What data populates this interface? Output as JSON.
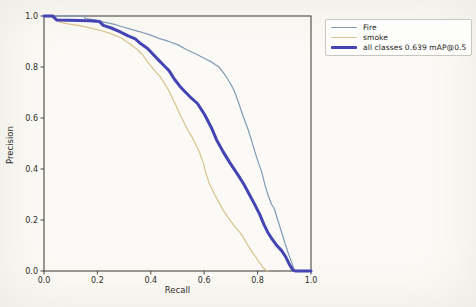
{
  "figure": {
    "xlabel": "Recall",
    "ylabel": "Precision"
  },
  "chart_data": {
    "type": "line",
    "title": "",
    "xlabel": "Recall",
    "ylabel": "Precision",
    "xlim": [
      0,
      1
    ],
    "ylim": [
      0,
      1
    ],
    "xticks": [
      0.0,
      0.2,
      0.4,
      0.6,
      0.8,
      1.0
    ],
    "yticks": [
      0.0,
      0.2,
      0.4,
      0.6,
      0.8,
      1.0
    ],
    "grid": false,
    "legend_position": "outside-upper-right",
    "frame_color": "#4a4741",
    "series": [
      {
        "name": "Fire",
        "color": "#7f9cb5",
        "linewidth": 1.2,
        "points": [
          [
            0,
            1
          ],
          [
            0.03,
            1
          ],
          [
            0.07,
            1
          ],
          [
            0.11,
            1
          ],
          [
            0.148,
            1
          ],
          [
            0.155,
            0.99
          ],
          [
            0.19,
            0.985
          ],
          [
            0.225,
            0.976
          ],
          [
            0.26,
            0.968
          ],
          [
            0.29,
            0.959
          ],
          [
            0.32,
            0.95
          ],
          [
            0.36,
            0.938
          ],
          [
            0.4,
            0.925
          ],
          [
            0.43,
            0.912
          ],
          [
            0.465,
            0.901
          ],
          [
            0.5,
            0.888
          ],
          [
            0.535,
            0.868
          ],
          [
            0.565,
            0.853
          ],
          [
            0.6,
            0.834
          ],
          [
            0.63,
            0.818
          ],
          [
            0.655,
            0.8
          ],
          [
            0.672,
            0.778
          ],
          [
            0.688,
            0.753
          ],
          [
            0.702,
            0.728
          ],
          [
            0.713,
            0.705
          ],
          [
            0.728,
            0.662
          ],
          [
            0.746,
            0.606
          ],
          [
            0.762,
            0.562
          ],
          [
            0.776,
            0.517
          ],
          [
            0.79,
            0.468
          ],
          [
            0.803,
            0.425
          ],
          [
            0.815,
            0.39
          ],
          [
            0.828,
            0.335
          ],
          [
            0.84,
            0.295
          ],
          [
            0.852,
            0.262
          ],
          [
            0.863,
            0.243
          ],
          [
            0.876,
            0.198
          ],
          [
            0.89,
            0.152
          ],
          [
            0.903,
            0.108
          ],
          [
            0.916,
            0.066
          ],
          [
            0.928,
            0.033
          ],
          [
            0.938,
            0.004
          ],
          [
            0.94,
            0
          ]
        ]
      },
      {
        "name": "smoke",
        "color": "#d9c38c",
        "linewidth": 1.2,
        "points": [
          [
            0,
            1
          ],
          [
            0.02,
            1
          ],
          [
            0.038,
            0.99
          ],
          [
            0.058,
            0.976
          ],
          [
            0.095,
            0.968
          ],
          [
            0.135,
            0.962
          ],
          [
            0.175,
            0.952
          ],
          [
            0.22,
            0.941
          ],
          [
            0.255,
            0.929
          ],
          [
            0.288,
            0.915
          ],
          [
            0.318,
            0.893
          ],
          [
            0.348,
            0.87
          ],
          [
            0.368,
            0.849
          ],
          [
            0.393,
            0.813
          ],
          [
            0.417,
            0.783
          ],
          [
            0.434,
            0.763
          ],
          [
            0.453,
            0.733
          ],
          [
            0.468,
            0.706
          ],
          [
            0.488,
            0.663
          ],
          [
            0.513,
            0.606
          ],
          [
            0.538,
            0.554
          ],
          [
            0.553,
            0.528
          ],
          [
            0.57,
            0.492
          ],
          [
            0.583,
            0.464
          ],
          [
            0.597,
            0.423
          ],
          [
            0.608,
            0.378
          ],
          [
            0.62,
            0.342
          ],
          [
            0.638,
            0.303
          ],
          [
            0.653,
            0.272
          ],
          [
            0.672,
            0.237
          ],
          [
            0.688,
            0.212
          ],
          [
            0.708,
            0.183
          ],
          [
            0.728,
            0.158
          ],
          [
            0.744,
            0.137
          ],
          [
            0.76,
            0.107
          ],
          [
            0.778,
            0.078
          ],
          [
            0.798,
            0.047
          ],
          [
            0.818,
            0.017
          ],
          [
            0.833,
            0.002
          ],
          [
            0.84,
            0
          ]
        ]
      },
      {
        "name": "all classes 0.639 mAP@0.5",
        "color": "#4444b4",
        "linewidth": 3,
        "points": [
          [
            0,
            1
          ],
          [
            0.033,
            1
          ],
          [
            0.048,
            0.984
          ],
          [
            0.09,
            0.983
          ],
          [
            0.13,
            0.982
          ],
          [
            0.17,
            0.981
          ],
          [
            0.208,
            0.978
          ],
          [
            0.222,
            0.963
          ],
          [
            0.252,
            0.953
          ],
          [
            0.283,
            0.939
          ],
          [
            0.313,
            0.923
          ],
          [
            0.342,
            0.91
          ],
          [
            0.363,
            0.891
          ],
          [
            0.388,
            0.873
          ],
          [
            0.412,
            0.846
          ],
          [
            0.433,
            0.823
          ],
          [
            0.452,
            0.803
          ],
          [
            0.468,
            0.786
          ],
          [
            0.488,
            0.753
          ],
          [
            0.508,
            0.726
          ],
          [
            0.528,
            0.703
          ],
          [
            0.547,
            0.683
          ],
          [
            0.575,
            0.657
          ],
          [
            0.602,
            0.613
          ],
          [
            0.627,
            0.562
          ],
          [
            0.646,
            0.515
          ],
          [
            0.67,
            0.469
          ],
          [
            0.696,
            0.425
          ],
          [
            0.726,
            0.378
          ],
          [
            0.748,
            0.341
          ],
          [
            0.768,
            0.302
          ],
          [
            0.788,
            0.263
          ],
          [
            0.808,
            0.222
          ],
          [
            0.824,
            0.182
          ],
          [
            0.84,
            0.148
          ],
          [
            0.855,
            0.124
          ],
          [
            0.872,
            0.1
          ],
          [
            0.89,
            0.08
          ],
          [
            0.905,
            0.056
          ],
          [
            0.918,
            0.028
          ],
          [
            0.932,
            0.004
          ],
          [
            0.94,
            0
          ],
          [
            1,
            0
          ]
        ]
      }
    ]
  }
}
